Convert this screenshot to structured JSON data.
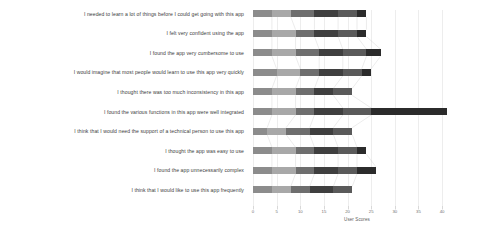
{
  "chart_data": {
    "type": "bar",
    "orientation": "horizontal",
    "stacked": true,
    "title": "",
    "xlabel": "User Scores",
    "ylabel": "",
    "xlim": [
      0,
      44
    ],
    "xticks": [
      0,
      5,
      10,
      15,
      20,
      25,
      30,
      35,
      40
    ],
    "xticklabels": [
      "0",
      "5",
      "10",
      "15",
      "20",
      "25",
      "30",
      "35",
      "40"
    ],
    "grid": true,
    "legend": "none",
    "categories": [
      "I needed to learn a lot of things before I could get going with this app",
      "I felt very confident using the app",
      "I found the app very cumbersome to use",
      "I would imagine that most people would learn to use this app very quickly",
      "I thought there was too much inconsistency in this app",
      "I found the various functions in this app were well integrated",
      "I think that I would need the support of a technical person to use this app",
      "I thought the app was easy to use",
      "I found the app unnecessarily complex",
      "I think that I would like to use this app frequently"
    ],
    "series": [
      {
        "name": "Strongly disagree",
        "color": "#8c8c8c",
        "values": [
          4,
          4,
          4,
          5,
          4,
          4,
          3,
          4,
          4,
          4
        ]
      },
      {
        "name": "Disagree",
        "color": "#a8a8a8",
        "values": [
          4,
          5,
          5,
          5,
          5,
          5,
          4,
          5,
          5,
          4
        ]
      },
      {
        "name": "Neutral",
        "color": "#6e6e6e",
        "values": [
          5,
          4,
          5,
          4,
          4,
          4,
          5,
          4,
          4,
          4
        ]
      },
      {
        "name": "Agree",
        "color": "#3f3f3f",
        "values": [
          5,
          5,
          5,
          5,
          4,
          6,
          5,
          5,
          5,
          5
        ]
      },
      {
        "name": "Strongly agree",
        "color": "#5a5a5a",
        "values": [
          4,
          4,
          5,
          4,
          4,
          6,
          4,
          4,
          4,
          4
        ]
      },
      {
        "name": "No answer",
        "color": "#2b2b2b",
        "values": [
          2,
          2,
          3,
          2,
          0,
          16,
          0,
          2,
          4,
          0
        ]
      }
    ],
    "totals": [
      24,
      24,
      27,
      25,
      21,
      41,
      21,
      24,
      26,
      21
    ]
  },
  "axis": {
    "x_title": "User Scores"
  }
}
